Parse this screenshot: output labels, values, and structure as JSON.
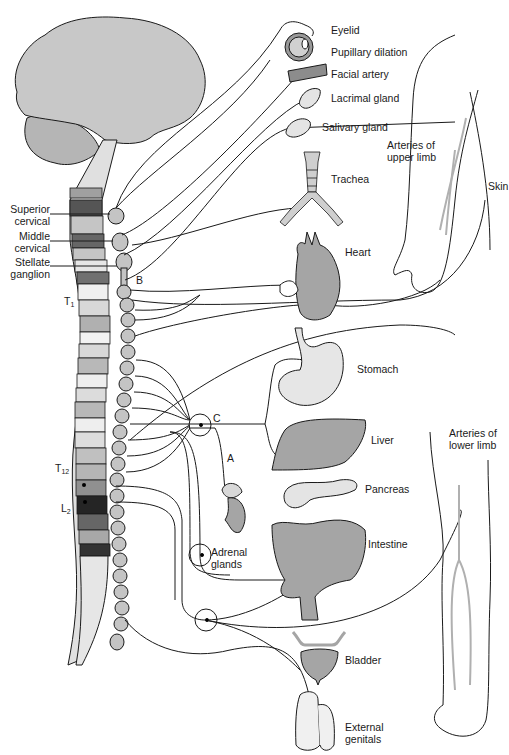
{
  "diagram": {
    "colors": {
      "brain": "#c8c8c8",
      "organ_dark": "#a5a5a5",
      "organ_light": "#e6e6e6",
      "chain": "#c4c4c4",
      "artery": "#b0b0b0",
      "stroke": "#1a1a1a"
    },
    "left_labels": {
      "superior_cervical": [
        "Superior",
        "cervical"
      ],
      "middle_cervical": [
        "Middle",
        "cervical"
      ],
      "stellate_ganglion": [
        "Stellate",
        "ganglion"
      ],
      "t1": {
        "base": "T",
        "sub": "1"
      },
      "t12": {
        "base": "T",
        "sub": "12"
      },
      "l2": {
        "base": "L",
        "sub": "2"
      }
    },
    "ganglion_labels": {
      "b": "B",
      "c": "C",
      "a": "A"
    },
    "organ_labels": {
      "eyelid": "Eyelid",
      "pupillary_dilation": "Pupillary dilation",
      "facial_artery": "Facial artery",
      "lacrimal_gland": "Lacrimal gland",
      "salivary_gland": "Salivary gland",
      "arteries_upper_limb": [
        "Arteries of",
        "upper limb"
      ],
      "skin": "Skin",
      "trachea": "Trachea",
      "heart": "Heart",
      "stomach": "Stomach",
      "liver": "Liver",
      "pancreas": "Pancreas",
      "arteries_lower_limb": [
        "Arteries of",
        "lower limb"
      ],
      "intestine": "Intestine",
      "adrenal_glands": [
        "Adrenal",
        "glands"
      ],
      "bladder": "Bladder",
      "external_genitals": [
        "External",
        "genitals"
      ]
    }
  }
}
